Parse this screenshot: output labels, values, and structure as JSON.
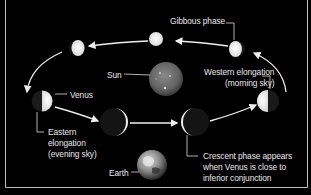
{
  "diagram": {
    "colors": {
      "background": "#000000",
      "frame": "#bdbdbd",
      "text": "#e8e8e8",
      "venus_lit": "#f4f4f4",
      "venus_dark": "#151515",
      "sun": "#6e6e6e",
      "earth": "#8a8a8a",
      "arrow": "#eeeeee"
    },
    "bodies": [
      {
        "name": "Sun",
        "type": "star"
      },
      {
        "name": "Earth",
        "type": "planet"
      }
    ],
    "venus_positions": [
      {
        "id": "top-center",
        "phase": "nearly full"
      },
      {
        "id": "top-left",
        "phase": "gibbous"
      },
      {
        "id": "top-right",
        "phase": "gibbous"
      },
      {
        "id": "left",
        "phase": "half (eastern elongation)"
      },
      {
        "id": "right",
        "phase": "half (western elongation)"
      },
      {
        "id": "bottom-left",
        "phase": "crescent"
      },
      {
        "id": "bottom-right",
        "phase": "crescent"
      }
    ],
    "labels": {
      "gibbous": "Gibbous phase",
      "sun": "Sun",
      "venus": "Venus",
      "western_line1": "Western elongation",
      "western_line2": "(morning sky)",
      "eastern_line1": "Eastern",
      "eastern_line2": "elongation",
      "eastern_line3": "(evening sky)",
      "earth": "Earth",
      "crescent_line1": "Crescent phase appears",
      "crescent_line2": "when Venus is close to",
      "crescent_line3": "inferior conjunction"
    }
  }
}
